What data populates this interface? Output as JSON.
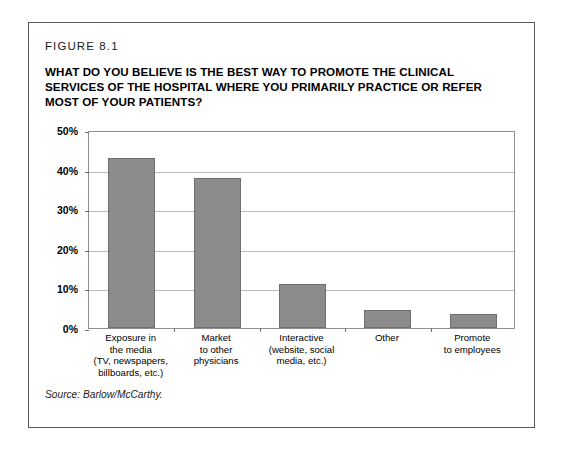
{
  "figure": {
    "label": "FIGURE 8.1",
    "title": "WHAT DO YOU BELIEVE IS THE BEST WAY TO PROMOTE THE CLINICAL SERVICES OF THE HOSPITAL WHERE YOU PRIMARILY PRACTICE OR REFER MOST OF YOUR PATIENTS?",
    "source": "Source: Barlow/McCarthy."
  },
  "colors": {
    "bar_fill": "#8c8c8c",
    "bar_stroke": "#6e6e6e",
    "gridline": "#b9b9b9",
    "frame": "#8f8f8f",
    "card_border": "#5a5a5a",
    "text": "#000000",
    "background": "#ffffff"
  },
  "chart_data": {
    "type": "bar",
    "title": "WHAT DO YOU BELIEVE IS THE BEST WAY TO PROMOTE THE CLINICAL SERVICES OF THE HOSPITAL WHERE YOU PRIMARILY PRACTICE OR REFER MOST OF YOUR PATIENTS?",
    "xlabel": "",
    "ylabel": "",
    "ylim": [
      0,
      50
    ],
    "ytick_labels": [
      "50%",
      "40%",
      "30%",
      "20%",
      "10%",
      "0%"
    ],
    "ytick_values": [
      50,
      40,
      30,
      20,
      10,
      0
    ],
    "grid": true,
    "legend": false,
    "categories": [
      "Exposure in the media (TV, newspapers, billboards, etc.)",
      "Market to other physicians",
      "Interactive (website, social media, etc.)",
      "Other",
      "Promote to employees"
    ],
    "category_lines": [
      [
        "Exposure in",
        "the media",
        "(TV, newspapers,",
        "billboards, etc.)"
      ],
      [
        "Market",
        "to other",
        "physicians"
      ],
      [
        "Interactive",
        "(website, social",
        "media, etc.)"
      ],
      [
        "Other"
      ],
      [
        "Promote",
        "to employees"
      ]
    ],
    "values": [
      43,
      38,
      11,
      4.5,
      3.5
    ],
    "source": "Source: Barlow/McCarthy."
  }
}
